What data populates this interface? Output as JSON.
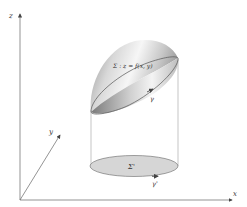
{
  "diagram": {
    "axes": {
      "x_label": "x",
      "y_label": "y",
      "z_label": "z"
    },
    "surface": {
      "label": "Σ : z = f(x, y)",
      "boundary_label": "γ"
    },
    "projection": {
      "label": "Σ'",
      "boundary_label": "γ'"
    },
    "colors": {
      "axis": "#555555",
      "surface_dark": "#8a8a8a",
      "surface_light": "#f4f4f4",
      "projection_fill": "#d6d6d6",
      "edge": "#555555"
    }
  }
}
